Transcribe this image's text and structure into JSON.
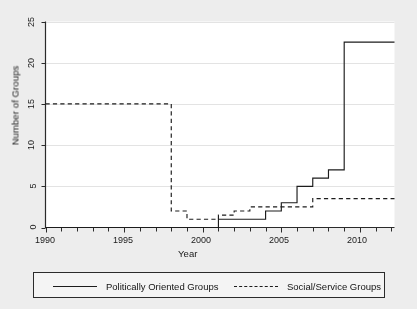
{
  "chart_data": {
    "type": "line",
    "title": "",
    "subtitle": "",
    "xlabel": "Year",
    "ylabel": "Number of Groups",
    "xlim": [
      1990,
      2012.2
    ],
    "ylim": [
      0,
      25
    ],
    "xticks": [
      1990,
      1995,
      2000,
      2005,
      2010
    ],
    "xtick_labels": [
      "1990",
      "1995",
      "2000",
      "2005",
      "2010"
    ],
    "xtick_minor_step": 1,
    "yticks": [
      0,
      5,
      10,
      15,
      20,
      25
    ],
    "ytick_labels": [
      "0",
      "5",
      "10",
      "15",
      "20",
      "25"
    ],
    "grid": "horizontal",
    "legend_position": "below-plot",
    "step_style": "post",
    "series": [
      {
        "name": "Politically Oriented Groups",
        "style": "solid",
        "color": "#1c1c1c",
        "x": [
          1990,
          2001,
          2004,
          2005,
          2006,
          2007,
          2008,
          2009,
          2012.2
        ],
        "values": [
          0,
          1,
          2,
          3,
          5,
          6,
          7,
          22.5,
          22.5
        ]
      },
      {
        "name": "Social/Service Groups",
        "style": "dashed",
        "color": "#1c1c1c",
        "x": [
          1990,
          1998,
          1999,
          2001,
          2002,
          2003,
          2007,
          2012.2
        ],
        "values": [
          15,
          2,
          1,
          1.5,
          2,
          2.5,
          3.5,
          3.5
        ]
      }
    ]
  },
  "axes": {
    "ylabel": "Number of Groups",
    "xlabel": "Year",
    "ytick_labels": [
      "0",
      "5",
      "10",
      "15",
      "20",
      "25"
    ],
    "xtick_labels": [
      "1990",
      "1995",
      "2000",
      "2005",
      "2010"
    ]
  },
  "legend": {
    "entries": [
      {
        "label": "Politically Oriented Groups",
        "style": "solid"
      },
      {
        "label": "Social/Service Groups",
        "style": "dashed"
      }
    ]
  },
  "colors": {
    "figure_background": "#ededed",
    "plot_background": "#ffffff",
    "axis": "#2b2b2b",
    "gridline": "#e3e3e3",
    "line": "#1c1c1c",
    "text": "#1a1a1a"
  }
}
